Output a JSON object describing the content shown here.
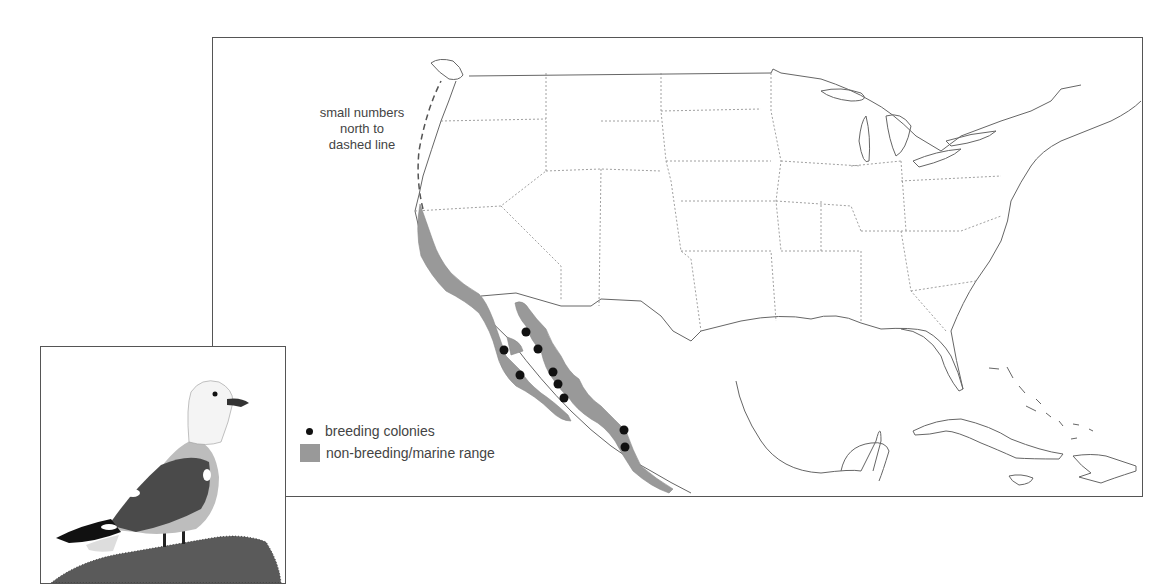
{
  "map": {
    "annotation": {
      "lines": [
        "small numbers",
        "north to",
        "dashed line"
      ]
    },
    "legend": {
      "items": [
        {
          "symbol": "dot",
          "label": "breeding colonies",
          "color": "#111111"
        },
        {
          "symbol": "swatch",
          "label": "non-breeding/marine range",
          "color": "#999999"
        }
      ]
    },
    "colors": {
      "range_fill": "#999999",
      "border_line": "#666666",
      "state_line": "#777777",
      "colony_dot": "#111111"
    },
    "breeding_colonies_count": 11
  },
  "inset": {
    "subject": "gull illustration standing on rock"
  }
}
